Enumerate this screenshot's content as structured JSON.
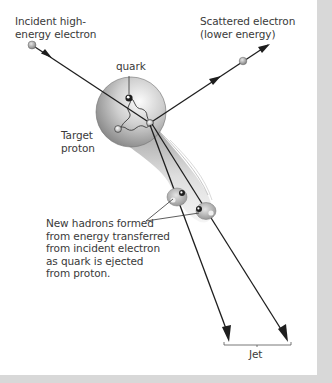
{
  "diagram": {
    "labels": {
      "incident_electron": "Incident high-\nenergy electron",
      "scattered_electron": "Scattered electron\n(lower energy)",
      "quark": "quark",
      "target_proton": "Target\nproton",
      "new_hadrons": "New hadrons formed\nfrom energy transferred\nfrom incident electron\nas quark is ejected\nfrom proton.",
      "jet": "Jet"
    },
    "icons": {
      "incident_electron": "electron-ball-icon",
      "scattered_electron": "electron-ball-icon",
      "proton": "proton-sphere-icon",
      "quarks": "quark-dot-icon",
      "gluons": "gluon-wavy-line-icon",
      "hadrons": "hadron-cluster-icon",
      "arrows": "arrowhead-icon"
    },
    "colors": {
      "background": "#d8d8d8",
      "panel": "#ffffff",
      "line": "#1e1e1e",
      "text": "#3a3a3a",
      "proton_light": "#f4f4f4",
      "proton_dark": "#8a8a8a",
      "electron": "#a8a8a8"
    }
  }
}
